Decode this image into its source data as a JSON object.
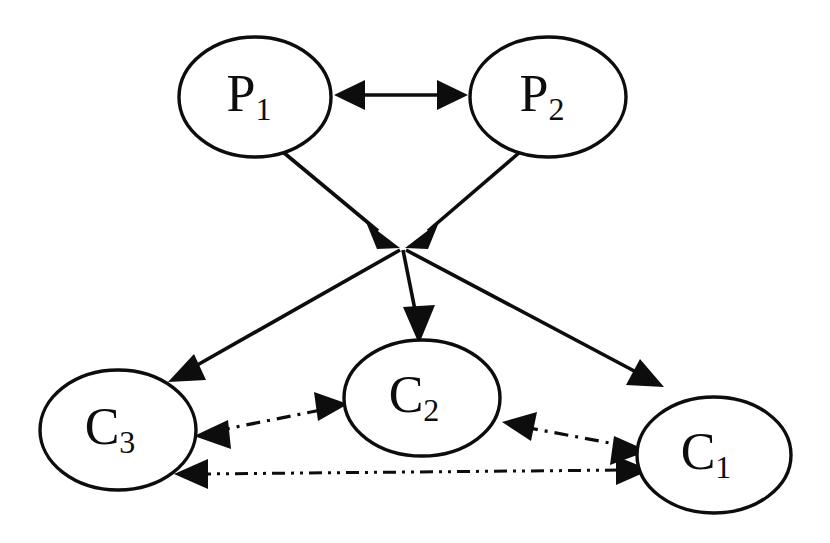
{
  "diagram": {
    "background_color": "#ffffff",
    "stroke_color": "#0d0d0d",
    "width": 830,
    "height": 543,
    "nodes": [
      {
        "id": "P1",
        "base": "P",
        "subscript": "1",
        "label": "P1",
        "cx": 255,
        "cy": 97,
        "rx": 76,
        "ry": 60,
        "role": "producer"
      },
      {
        "id": "P2",
        "base": "P",
        "subscript": "2",
        "label": "P2",
        "cx": 548,
        "cy": 97,
        "rx": 78,
        "ry": 60,
        "role": "producer"
      },
      {
        "id": "C3",
        "base": "C",
        "subscript": "3",
        "label": "C3",
        "cx": 118,
        "cy": 430,
        "rx": 78,
        "ry": 60,
        "role": "consumer"
      },
      {
        "id": "C2",
        "base": "C",
        "subscript": "2",
        "label": "C2",
        "cx": 422,
        "cy": 398,
        "rx": 78,
        "ry": 58,
        "role": "consumer"
      },
      {
        "id": "C1",
        "base": "C",
        "subscript": "1",
        "label": "C1",
        "cx": 714,
        "cy": 455,
        "rx": 77,
        "ry": 58,
        "role": "consumer"
      }
    ],
    "hub": {
      "id": "junction",
      "x": 402,
      "y": 246,
      "label": ""
    },
    "edges": [
      {
        "id": "p1-p2",
        "from": "P1",
        "to": "P2",
        "style": "solid",
        "arrows": "both",
        "x1": 338,
        "y1": 95,
        "x2": 464,
        "y2": 95
      },
      {
        "id": "p1-hub",
        "from": "P1",
        "to": "junction",
        "style": "solid",
        "arrows": "end",
        "x1": 283,
        "y1": 152,
        "x2": 392,
        "y2": 243
      },
      {
        "id": "p2-hub",
        "from": "P2",
        "to": "junction",
        "style": "solid",
        "arrows": "end",
        "x1": 520,
        "y1": 152,
        "x2": 412,
        "y2": 243
      },
      {
        "id": "hub-c3",
        "from": "junction",
        "to": "C3",
        "style": "solid",
        "arrows": "end",
        "x1": 400,
        "y1": 250,
        "x2": 175,
        "y2": 378
      },
      {
        "id": "hub-c2",
        "from": "junction",
        "to": "C2",
        "style": "solid",
        "arrows": "end",
        "x1": 403,
        "y1": 250,
        "x2": 418,
        "y2": 343
      },
      {
        "id": "hub-c1",
        "from": "junction",
        "to": "C1",
        "style": "solid",
        "arrows": "end",
        "x1": 406,
        "y1": 250,
        "x2": 658,
        "y2": 385
      },
      {
        "id": "c3-c2",
        "from": "C3",
        "to": "C2",
        "style": "dash-dot",
        "arrows": "both",
        "x1": 196,
        "y1": 434,
        "x2": 344,
        "y2": 405
      },
      {
        "id": "c2-c1",
        "from": "C2",
        "to": "C1",
        "style": "dash-dot",
        "arrows": "both",
        "x1": 504,
        "y1": 423,
        "x2": 644,
        "y2": 449
      },
      {
        "id": "c3-c1",
        "from": "C3",
        "to": "C1",
        "style": "dash-dot-dot",
        "arrows": "both",
        "x1": 176,
        "y1": 474,
        "x2": 648,
        "y2": 470
      }
    ]
  }
}
